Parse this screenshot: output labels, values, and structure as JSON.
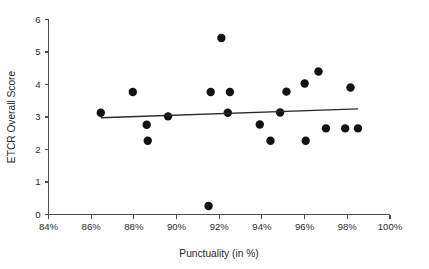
{
  "chart_data": {
    "type": "scatter",
    "title": "",
    "subtitle": "",
    "xlabel": "Punctuality (in %)",
    "ylabel": "ETCR Overall Score",
    "xlim": [
      84,
      100
    ],
    "ylim": [
      0,
      6
    ],
    "grid": false,
    "legend": null,
    "x_tick_labels": [
      "84%",
      "86%",
      "88%",
      "90%",
      "92%",
      "94%",
      "96%",
      "98%",
      "100%"
    ],
    "x_ticks": [
      84,
      86,
      88,
      90,
      92,
      94,
      96,
      98,
      100
    ],
    "y_tick_labels": [
      "0",
      "1",
      "2",
      "3",
      "4",
      "5",
      "6"
    ],
    "y_ticks": [
      0,
      1,
      2,
      3,
      4,
      5,
      6
    ],
    "series": [
      {
        "name": "observations",
        "marker": "filled-circle",
        "marker_color": "#111111",
        "marker_size": 5.2,
        "points": [
          {
            "x": 86.45,
            "y": 3.13
          },
          {
            "x": 87.95,
            "y": 3.77
          },
          {
            "x": 88.6,
            "y": 2.76
          },
          {
            "x": 88.65,
            "y": 2.27
          },
          {
            "x": 89.6,
            "y": 3.02
          },
          {
            "x": 91.5,
            "y": 0.26
          },
          {
            "x": 91.6,
            "y": 3.77
          },
          {
            "x": 92.1,
            "y": 5.43
          },
          {
            "x": 92.4,
            "y": 3.13
          },
          {
            "x": 92.5,
            "y": 3.77
          },
          {
            "x": 93.9,
            "y": 2.77
          },
          {
            "x": 94.4,
            "y": 2.27
          },
          {
            "x": 94.85,
            "y": 3.14
          },
          {
            "x": 95.15,
            "y": 3.78
          },
          {
            "x": 96.0,
            "y": 4.03
          },
          {
            "x": 96.05,
            "y": 2.27
          },
          {
            "x": 96.65,
            "y": 4.4
          },
          {
            "x": 97.0,
            "y": 2.65
          },
          {
            "x": 97.9,
            "y": 2.65
          },
          {
            "x": 98.15,
            "y": 3.91
          },
          {
            "x": 98.5,
            "y": 2.65
          }
        ]
      }
    ],
    "trend_line": {
      "name": "linear-fit",
      "color": "#2a2a2a",
      "x_start": 86.45,
      "y_start": 2.98,
      "x_end": 98.5,
      "y_end": 3.25
    }
  }
}
